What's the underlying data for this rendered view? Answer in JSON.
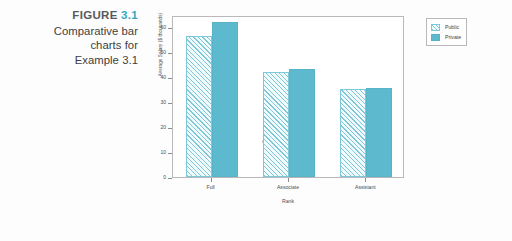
{
  "caption": {
    "figure_word": "FIGURE",
    "figure_number": "3.1",
    "line1": "Comparative bar",
    "line2": "charts for",
    "line3": "Example 3.1",
    "accent_color": "#35a8bf"
  },
  "legend": {
    "position": "right",
    "items": [
      {
        "label": "Public",
        "swatch": "hatched-swatch-icon"
      },
      {
        "label": "Private",
        "swatch": "solid-swatch-icon"
      }
    ]
  },
  "chart_data": {
    "type": "bar",
    "title": "",
    "categories": [
      "Full",
      "Associate",
      "Assistant"
    ],
    "series": [
      {
        "name": "Public",
        "values": [
          56.5,
          42.2,
          35.5
        ],
        "color": "#7ec8da",
        "fill": "hatched"
      },
      {
        "name": "Private",
        "values": [
          62.0,
          43.3,
          35.7
        ],
        "color": "#5cb9ce",
        "fill": "solid"
      }
    ],
    "xlabel": "Rank",
    "ylabel": "Average Salary ($ thousands)",
    "ylim": [
      0,
      65
    ],
    "yticks": [
      0,
      10,
      20,
      30,
      40,
      50,
      60
    ],
    "ytick_labels": [
      "0",
      "10",
      "20",
      "30",
      "40",
      "50",
      "60"
    ],
    "grid": false,
    "legend_position": "right"
  }
}
